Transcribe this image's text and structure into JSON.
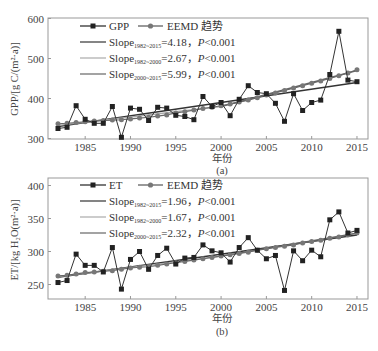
{
  "chart_data": [
    {
      "type": "line",
      "panel_label": "(a)",
      "xlabel": "年份",
      "ylabel": "GPP/[g C/(m²·a)]",
      "ylim": [
        300,
        600
      ],
      "xlim": [
        1981.3,
        2016.2
      ],
      "yticks": [
        300,
        400,
        500,
        600
      ],
      "xticks": [
        1985,
        1990,
        1995,
        2000,
        2005,
        2010,
        2015
      ],
      "grid": false,
      "legend_position": "upper left",
      "x": [
        1982,
        1983,
        1984,
        1985,
        1986,
        1987,
        1988,
        1989,
        1990,
        1991,
        1992,
        1993,
        1994,
        1995,
        1996,
        1997,
        1998,
        1999,
        2000,
        2001,
        2002,
        2003,
        2004,
        2005,
        2006,
        2007,
        2008,
        2009,
        2010,
        2011,
        2012,
        2013,
        2014,
        2015
      ],
      "series": [
        {
          "name": "GPP",
          "marker": "square",
          "color": "#222222",
          "values": [
            325,
            328,
            382,
            348,
            338,
            338,
            380,
            303,
            376,
            373,
            345,
            378,
            376,
            358,
            355,
            347,
            405,
            380,
            390,
            357,
            398,
            432,
            415,
            412,
            388,
            343,
            412,
            370,
            390,
            396,
            460,
            568,
            446,
            442
          ]
        },
        {
          "name": "EEMD 趋势",
          "marker": "circle",
          "color": "#777777",
          "values": [
            337,
            338,
            340,
            342,
            344,
            345,
            346,
            347,
            349,
            351,
            353,
            356,
            359,
            364,
            367,
            371,
            375,
            378,
            382,
            386,
            391,
            396,
            402,
            409,
            414,
            420,
            426,
            432,
            438,
            444,
            450,
            457,
            464,
            472
          ]
        }
      ],
      "trend_lines": [
        {
          "label": "Slope",
          "period": "1982~2015",
          "slope": 4.18,
          "p": "P<0.001",
          "x": [
            1982,
            2015
          ],
          "y": [
            330,
            440
          ],
          "color": "#333333"
        },
        {
          "label": "Slope",
          "period": "1982~2000",
          "slope": 2.67,
          "p": "P<0.001",
          "x": [
            1982,
            2000
          ],
          "y": [
            333,
            380
          ],
          "color": "#aaaaaa"
        },
        {
          "label": "Slope",
          "period": "2000~2015",
          "slope": 5.99,
          "p": "P<0.001",
          "x": [
            2000,
            2015
          ],
          "y": [
            380,
            470
          ],
          "color": "#666666"
        }
      ]
    },
    {
      "type": "line",
      "panel_label": "(b)",
      "xlabel": "年份",
      "ylabel": "ET/[kg H₂O(m²·a)]",
      "ylim": [
        225,
        410
      ],
      "xlim": [
        1981.3,
        2016.2
      ],
      "yticks": [
        250,
        300,
        350,
        400
      ],
      "xticks": [
        1985,
        1990,
        1995,
        2000,
        2005,
        2010,
        2015
      ],
      "grid": false,
      "legend_position": "upper left",
      "x": [
        1982,
        1983,
        1984,
        1985,
        1986,
        1987,
        1988,
        1989,
        1990,
        1991,
        1992,
        1993,
        1994,
        1995,
        1996,
        1997,
        1998,
        1999,
        2000,
        2001,
        2002,
        2003,
        2004,
        2005,
        2006,
        2007,
        2008,
        2009,
        2010,
        2011,
        2012,
        2013,
        2014,
        2015
      ],
      "series": [
        {
          "name": "ET",
          "marker": "square",
          "color": "#222222",
          "values": [
            253,
            256,
            296,
            279,
            279,
            269,
            306,
            243,
            288,
            300,
            273,
            294,
            305,
            281,
            290,
            291,
            310,
            301,
            298,
            284,
            306,
            321,
            302,
            289,
            294,
            241,
            301,
            286,
            302,
            292,
            348,
            360,
            328,
            332
          ]
        },
        {
          "name": "EEMD 趋势",
          "marker": "circle",
          "color": "#777777",
          "values": [
            263,
            264,
            266,
            268,
            269,
            270,
            271,
            273,
            275,
            276,
            277,
            279,
            281,
            283,
            285,
            287,
            289,
            291,
            293,
            295,
            297,
            299,
            302,
            304,
            306,
            308,
            310,
            313,
            315,
            317,
            320,
            322,
            325,
            328
          ]
        }
      ],
      "trend_lines": [
        {
          "label": "Slope",
          "period": "1982~2015",
          "slope": 1.96,
          "p": "P<0.001",
          "x": [
            1982,
            2015
          ],
          "y": [
            261,
            325
          ],
          "color": "#333333"
        },
        {
          "label": "Slope",
          "period": "1982~2000",
          "slope": 1.67,
          "p": "P<0.001",
          "x": [
            1982,
            2000
          ],
          "y": [
            262,
            293
          ],
          "color": "#aaaaaa"
        },
        {
          "label": "Slope",
          "period": "2000~2015",
          "slope": 2.32,
          "p": "P<0.001",
          "x": [
            2000,
            2015
          ],
          "y": [
            293,
            328
          ],
          "color": "#666666"
        }
      ]
    }
  ],
  "legend": {
    "a": {
      "series1": "GPP",
      "series2": "EEMD 趋势",
      "l1_pre": "Slope",
      "l1_sub": "1982~2015",
      "l1_post": "=4.18，",
      "l1_p": "P",
      "l1_tail": "<0.001",
      "l2_pre": "Slope",
      "l2_sub": "1982~2000",
      "l2_post": "=2.67，",
      "l2_p": "P",
      "l2_tail": "<0.001",
      "l3_pre": "Slope",
      "l3_sub": "2000~2015",
      "l3_post": "=5.99，",
      "l3_p": "P",
      "l3_tail": "<0.001"
    },
    "b": {
      "series1": "ET",
      "series2": "EEMD 趋势",
      "l1_pre": "Slope",
      "l1_sub": "1982~2015",
      "l1_post": "=1.96，",
      "l1_p": "P",
      "l1_tail": "<0.001",
      "l2_pre": "Slope",
      "l2_sub": "1982~2000",
      "l2_post": "=1.67，",
      "l2_p": "P",
      "l2_tail": "<0.001",
      "l3_pre": "Slope",
      "l3_sub": "2000~2015",
      "l3_post": "=2.32，",
      "l3_p": "P",
      "l3_tail": "<0.001"
    }
  },
  "labels": {
    "a_ylabel": "GPP/[g C/(m²·a)]",
    "b_ylabel": "ET/[kg H₂O(m²·a)]",
    "xlabel": "年份",
    "a_caption": "(a)",
    "b_caption": "(b)"
  }
}
